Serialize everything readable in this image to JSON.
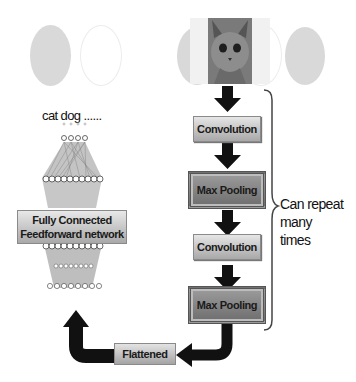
{
  "diagram": {
    "input_image": "cat-photo",
    "output_labels": "cat dog ......",
    "layers": [
      {
        "label": "Convolution",
        "type": "convolution"
      },
      {
        "label": "Max Pooling",
        "type": "pooling"
      },
      {
        "label": "Convolution",
        "type": "convolution"
      },
      {
        "label": "Max Pooling",
        "type": "pooling"
      }
    ],
    "flattened_label": "Flattened",
    "fc_label_line1": "Fully Connected",
    "fc_label_line2": "Feedforward network",
    "repeat_note_line1": "Can repeat",
    "repeat_note_line2": "many",
    "repeat_note_line3": "times"
  }
}
